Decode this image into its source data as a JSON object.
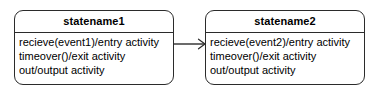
{
  "diagram": {
    "type": "uml-state-diagram",
    "background_color": "#ffffff",
    "stroke_color": "#2b2b2b",
    "text_color": "#000000",
    "states": [
      {
        "id": "state1",
        "title": "statename1",
        "lines": [
          "recieve(event1)/entry activity",
          "timeover()/exit activity",
          "out/output activity"
        ]
      },
      {
        "id": "state2",
        "title": "statename2",
        "lines": [
          "recieve(event2)/entry activity",
          "timeover()/exit activity",
          "out/output activity"
        ]
      }
    ],
    "transitions": [
      {
        "id": "t1",
        "from": "state1",
        "to": "state2",
        "label": "",
        "arrowhead": "open"
      }
    ]
  }
}
